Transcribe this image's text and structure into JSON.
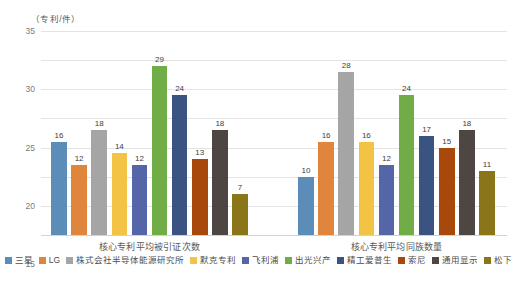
{
  "chart_data": {
    "type": "bar",
    "title": "",
    "subtitle": "",
    "xlabel": "",
    "ylabel": "（专利/件）",
    "ylim": [
      0,
      35
    ],
    "ytick_values": [
      35,
      30,
      25,
      20,
      15,
      10,
      5,
      0
    ],
    "ytick_labels": [
      "35",
      "30",
      "25",
      "20",
      "15",
      "10",
      "5",
      "0"
    ],
    "grid": true,
    "legend_position": "bottom",
    "categories": [
      "核心专利平均被引证次数",
      "核心专利平均同族数量"
    ],
    "series": [
      {
        "name": "三星",
        "color": "#5b8db8",
        "values": [
          16,
          10
        ]
      },
      {
        "name": "LG",
        "color": "#e0863c",
        "values": [
          12,
          16
        ]
      },
      {
        "name": "株式会社半导体能源研究所",
        "color": "#a5a5a5",
        "values": [
          18,
          28
        ]
      },
      {
        "name": "默克专利",
        "color": "#f2c344",
        "values": [
          14,
          16
        ]
      },
      {
        "name": "飞利浦",
        "color": "#5566a8",
        "values": [
          12,
          12
        ]
      },
      {
        "name": "出光兴产",
        "color": "#70ad47",
        "values": [
          29,
          24
        ]
      },
      {
        "name": "精工爱普生",
        "color": "#3a5381",
        "values": [
          24,
          17
        ]
      },
      {
        "name": "索尼",
        "color": "#a8490b",
        "values": [
          13,
          15
        ]
      },
      {
        "name": "通用显示",
        "color": "#4d4642",
        "values": [
          18,
          18
        ]
      },
      {
        "name": "松下",
        "color": "#8a7519",
        "values": [
          7,
          11
        ]
      }
    ]
  }
}
